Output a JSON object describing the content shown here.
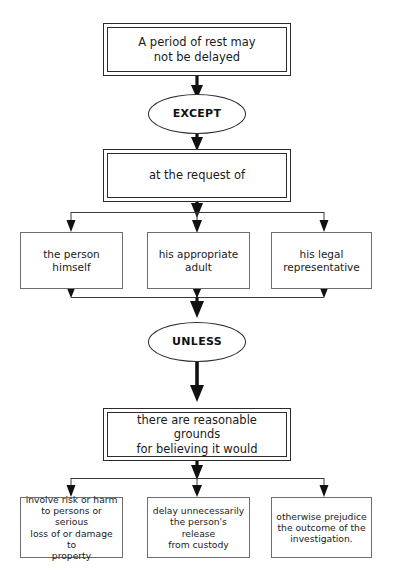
{
  "diagram": {
    "title_text": "A period of rest may not be delayed",
    "nodes": {
      "top_statement": "A period of rest may\nnot be delayed",
      "except_connector": "EXCEPT",
      "request_statement": "at the request of",
      "requesters": [
        "the person\nhimself",
        "his appropriate\nadult",
        "his legal\nrepresentative"
      ],
      "unless_connector": "UNLESS",
      "grounds_statement": "there are reasonable grounds\nfor believing it would",
      "outcomes": [
        "involve risk or harm\nto persons or serious\nloss of or damage to\nproperty",
        "delay unnecessarily\nthe person's release\nfrom custody",
        "otherwise prejudice\nthe outcome of the\ninvestigation."
      ]
    },
    "colors": {
      "background": "#ffffff",
      "emphasis_border": "#2b2b2b",
      "branch_border": "#6e6e6e",
      "connector_line": "#3a3a3a",
      "arrow_fill": "#111111",
      "text": "#1a1a1a"
    }
  }
}
